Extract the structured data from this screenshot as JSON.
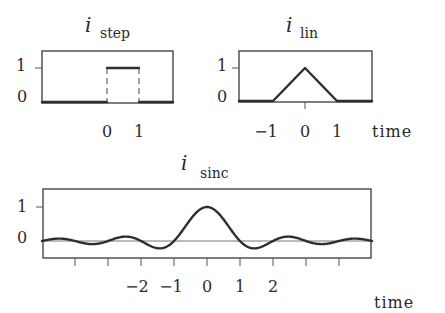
{
  "panels": {
    "step": {
      "title_main": "i",
      "title_sub": "step",
      "ytick_labels": [
        "1",
        "0"
      ],
      "xtick_labels": [
        "0",
        "1"
      ],
      "xlabel": ""
    },
    "lin": {
      "title_main": "i",
      "title_sub": "lin",
      "ytick_labels": [
        "1",
        "0"
      ],
      "xtick_labels": [
        "−1",
        "0",
        "1"
      ],
      "xlabel": "time"
    },
    "sinc": {
      "title_main": "i",
      "title_sub": "sinc",
      "ytick_labels": [
        "1",
        "0"
      ],
      "xtick_labels": [
        "−2",
        "−1",
        "0",
        "1",
        "2"
      ],
      "xlabel": "time"
    }
  },
  "colors": {
    "curve": "#2e2e2e",
    "frame": "#3a3a3a",
    "background": "#ffffff"
  },
  "chart_data": [
    {
      "type": "line",
      "title": "i_step",
      "xlabel": "time",
      "ylabel": "",
      "x": [
        -3,
        0,
        0,
        1,
        1,
        3
      ],
      "series": [
        {
          "name": "i_step",
          "values": [
            0,
            0,
            1,
            1,
            0,
            0
          ]
        }
      ],
      "xticks": [
        0,
        1
      ],
      "yticks": [
        0,
        1
      ],
      "xlim": [
        -3.0,
        1.0
      ],
      "ylim": [
        0,
        1.5
      ],
      "notes": "rectangular pulse from t=0 to t=1, vertical edges drawn dashed"
    },
    {
      "type": "line",
      "title": "i_lin",
      "xlabel": "time",
      "ylabel": "",
      "x": [
        -3,
        -1,
        0,
        1,
        3
      ],
      "series": [
        {
          "name": "i_lin",
          "values": [
            0,
            0,
            1,
            0,
            0
          ]
        }
      ],
      "xticks": [
        -1,
        0,
        1
      ],
      "yticks": [
        0,
        1
      ],
      "xlim": [
        -3,
        2
      ],
      "ylim": [
        0,
        1.5
      ]
    },
    {
      "type": "line",
      "title": "i_sinc",
      "xlabel": "time",
      "ylabel": "",
      "function": "sin(pi t)/(pi t)",
      "x": [
        -5,
        -4.5,
        -4,
        -3.5,
        -3,
        -2.5,
        -2,
        -1.5,
        -1,
        -0.5,
        0,
        0.5,
        1,
        1.5,
        2,
        2.5,
        3,
        3.5,
        4,
        4.5,
        5
      ],
      "series": [
        {
          "name": "i_sinc",
          "values": [
            0,
            0.071,
            0,
            -0.091,
            0,
            0.127,
            0,
            -0.212,
            0,
            0.637,
            1,
            0.637,
            0,
            -0.212,
            0,
            0.127,
            0,
            -0.091,
            0,
            0.071,
            0
          ]
        }
      ],
      "xticks": [
        -4,
        -3,
        -2,
        -1,
        0,
        1,
        2,
        3,
        4
      ],
      "xtick_labels_shown": [
        -2,
        -1,
        0,
        1,
        2
      ],
      "yticks": [
        0,
        1
      ],
      "xlim": [
        -5,
        5
      ],
      "ylim": [
        -0.5,
        1.5
      ],
      "grid": false
    }
  ]
}
